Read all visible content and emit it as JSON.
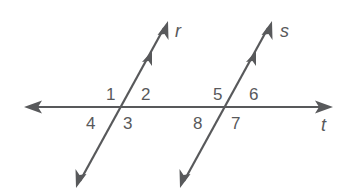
{
  "diagram": {
    "type": "parallel lines cut by a transversal",
    "colors": {
      "ink": "#58595b",
      "background": "#ffffff"
    },
    "lines": {
      "r": {
        "label": "r",
        "role": "parallel line",
        "has_parallel_mark": true
      },
      "s": {
        "label": "s",
        "role": "parallel line",
        "has_parallel_mark": true
      },
      "t": {
        "label": "t",
        "role": "transversal"
      }
    },
    "angles": {
      "a1": "1",
      "a2": "2",
      "a3": "3",
      "a4": "4",
      "a5": "5",
      "a6": "6",
      "a7": "7",
      "a8": "8"
    }
  }
}
